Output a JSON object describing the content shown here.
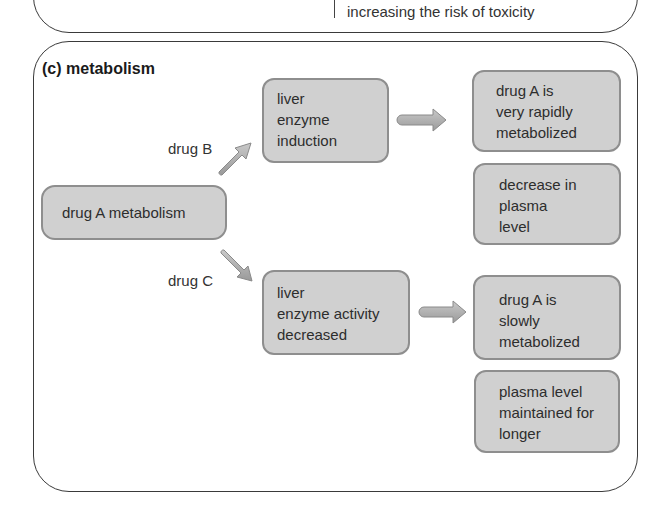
{
  "top_panel": {
    "text": "increasing the risk of toxicity"
  },
  "panel": {
    "title": "(c) metabolism",
    "source_box": "drug A metabolism",
    "branches": [
      {
        "drug_label": "drug B",
        "cause": "liver\nenzyme\ninduction",
        "effects": [
          "drug A is\nvery rapidly\nmetabolized",
          "decrease in\nplasma\nlevel"
        ]
      },
      {
        "drug_label": "drug C",
        "cause": "liver\nenzyme activity\ndecreased",
        "effects": [
          "drug A is\nslowly\nmetabolized",
          "plasma level\nmaintained for\nlonger"
        ]
      }
    ]
  },
  "colors": {
    "box_fill": "#d0d0d0",
    "box_border": "#8e8e8e",
    "arrow": "#a8a8a8",
    "frame": "#3a3a3a"
  }
}
